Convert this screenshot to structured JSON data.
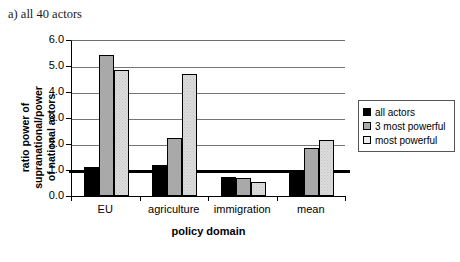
{
  "caption": "a) all 40 actors",
  "chart_data": {
    "type": "bar",
    "title": "a) all 40 actors",
    "xlabel": "policy domain",
    "ylabel": "ratio power of supranational/power of national actors",
    "ylabel_line1": "ratio power of supranational/power",
    "ylabel_line2": "of national actors",
    "categories": [
      "EU",
      "agriculture",
      "immigration",
      "mean"
    ],
    "ylim": [
      0.0,
      6.0
    ],
    "ytick_values": [
      0.0,
      1.0,
      2.0,
      3.0,
      4.0,
      5.0,
      6.0
    ],
    "ytick_labels": [
      "0.0",
      "1.0",
      "2.0",
      "3.0",
      "4.0",
      "5.0",
      "6.0"
    ],
    "grid": true,
    "reference_line": 1.0,
    "legend_position": "right",
    "series": [
      {
        "name": "all actors",
        "color": "#000000",
        "values": [
          1.12,
          1.2,
          0.72,
          1.0
        ]
      },
      {
        "name": "3 most powerful",
        "color": "#a9a9a9",
        "values": [
          5.42,
          2.25,
          0.68,
          1.85
        ]
      },
      {
        "name": "most powerful",
        "color": "#dcdcdc",
        "values": [
          4.85,
          4.7,
          0.52,
          2.15
        ]
      }
    ]
  }
}
